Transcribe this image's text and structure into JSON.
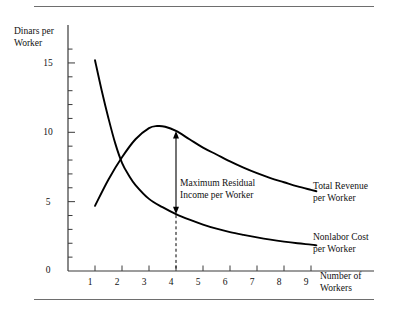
{
  "figure": {
    "background_color": "#ffffff",
    "ink_color": "#000000",
    "rule_color": "#6e6e6e",
    "has_top_rule": true,
    "has_bottom_rule": true
  },
  "chart_data": {
    "type": "line",
    "title": "",
    "ylabel": "Dinars per\nWorker",
    "ylabel_line1": "Dinars per",
    "ylabel_line2": "Worker",
    "xlabel": "Number of\nWorkers",
    "xlabel_line1": "Number of",
    "xlabel_line2": "Workers",
    "xlim": [
      0,
      10.2
    ],
    "ylim": [
      0,
      16.5
    ],
    "grid": false,
    "legend_position": "inline-right-of-curve-ends",
    "x_ticks_major": [
      1,
      2,
      3,
      4,
      5,
      6,
      7,
      8,
      9
    ],
    "x_tick_labels": [
      "1",
      "2",
      "3",
      "4",
      "5",
      "6",
      "7",
      "8",
      "9"
    ],
    "y_ticks_minor": [
      1,
      2,
      3,
      4,
      6,
      7,
      8,
      9,
      11,
      12,
      13,
      14,
      16
    ],
    "y_ticks_major": [
      0,
      5,
      10,
      15
    ],
    "y_tick_labels": [
      "0",
      "5",
      "10",
      "15"
    ],
    "series": [
      {
        "name": "Total Revenue per Worker",
        "label_line1": "Total Revenue",
        "label_line2": "per Worker",
        "x": [
          1.0,
          1.5,
          2.0,
          2.5,
          3.0,
          3.3,
          3.6,
          4.0,
          4.5,
          5.0,
          5.5,
          6.0,
          6.5,
          7.0,
          7.5,
          8.0,
          8.5,
          9.0,
          9.2
        ],
        "values": [
          4.7,
          6.6,
          8.2,
          9.5,
          10.3,
          10.45,
          10.4,
          10.1,
          9.5,
          8.9,
          8.4,
          7.9,
          7.45,
          7.05,
          6.7,
          6.4,
          6.1,
          5.85,
          5.75
        ]
      },
      {
        "name": "Nonlabor Cost per Worker",
        "label_line1": "Nonlabor Cost",
        "label_line2": "per Worker",
        "x": [
          1.0,
          1.25,
          1.5,
          1.75,
          2.0,
          2.25,
          2.5,
          3.0,
          3.5,
          4.0,
          4.5,
          5.0,
          5.5,
          6.0,
          6.5,
          7.0,
          7.5,
          8.0,
          8.5,
          9.0,
          9.2
        ],
        "values": [
          15.2,
          13.0,
          11.0,
          9.2,
          7.8,
          6.9,
          6.2,
          5.2,
          4.6,
          4.1,
          3.7,
          3.35,
          3.05,
          2.8,
          2.6,
          2.42,
          2.26,
          2.12,
          2.0,
          1.9,
          1.85
        ]
      }
    ],
    "annotations": [
      {
        "name": "maximum-residual-income-annotation",
        "text_line1": "Maximum Residual",
        "text_line2": "Income per Worker",
        "arrow_x": 4,
        "arrow_y_top": 10.1,
        "arrow_y_bottom": 4.1,
        "arrow_style": "double-headed",
        "dashed_drop_from": 4.1,
        "dashed_drop_to": 0
      }
    ],
    "intersection": {
      "x": 2.2,
      "y": 7.3
    }
  }
}
